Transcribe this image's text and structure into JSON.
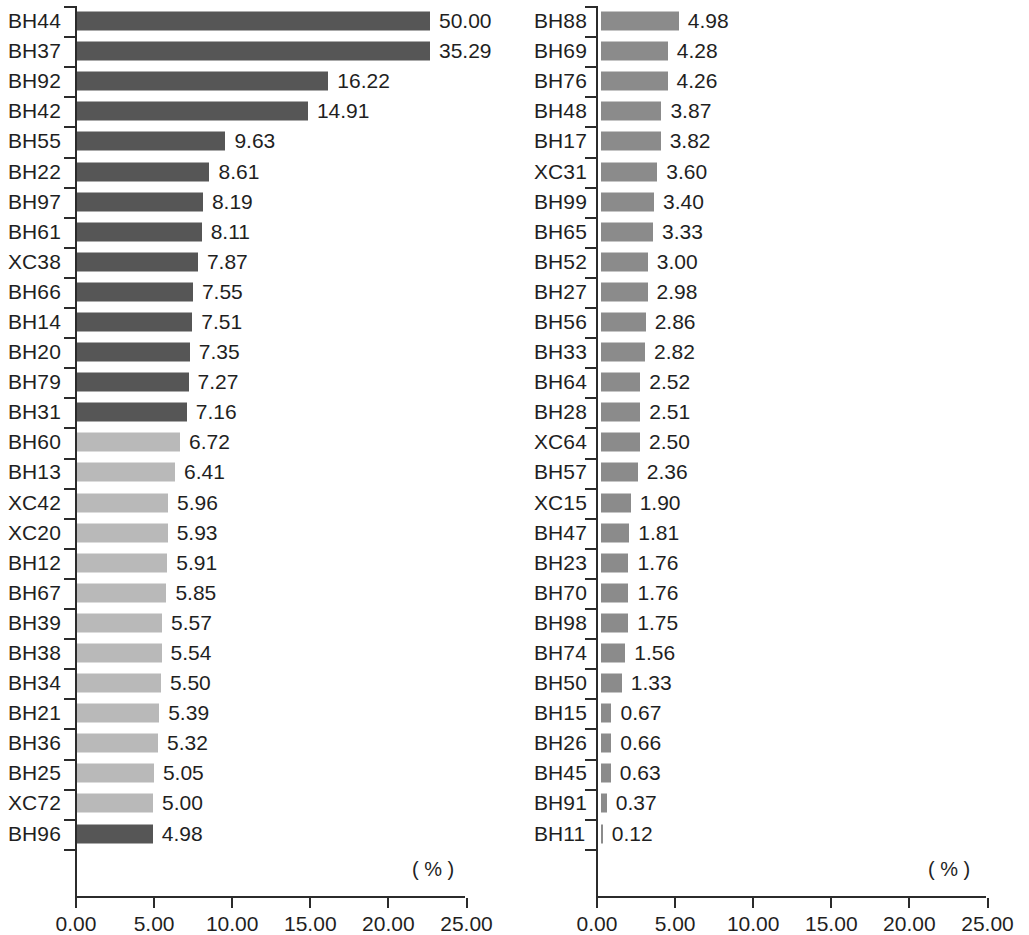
{
  "chart_data": [
    {
      "type": "bar",
      "orientation": "horizontal",
      "panel": "left",
      "title": "",
      "xlabel": "( % )",
      "ylabel": "",
      "xlim": [
        0,
        25
      ],
      "xticks": [
        0,
        5,
        10,
        15,
        20,
        25
      ],
      "xtick_labels": [
        "0.00",
        "5.00",
        "10.00",
        "15.00",
        "20.00",
        "25.00"
      ],
      "grid": false,
      "legend": "none",
      "clipped_note": "Bars exceeding 25.00 are drawn clipped at the plot edge",
      "colors": {
        "dark": "#565656",
        "light": "#b9b9b9"
      },
      "categories": [
        "BH44",
        "BH37",
        "BH92",
        "BH42",
        "BH55",
        "BH22",
        "BH97",
        "BH61",
        "XC38",
        "BH66",
        "BH14",
        "BH20",
        "BH79",
        "BH31",
        "BH60",
        "BH13",
        "XC42",
        "XC20",
        "BH12",
        "BH67",
        "BH39",
        "BH38",
        "BH34",
        "BH21",
        "BH36",
        "BH25",
        "XC72",
        "BH96"
      ],
      "values": [
        50.0,
        35.29,
        16.22,
        14.91,
        9.63,
        8.61,
        8.19,
        8.11,
        7.87,
        7.55,
        7.51,
        7.35,
        7.27,
        7.16,
        6.72,
        6.41,
        5.96,
        5.93,
        5.91,
        5.85,
        5.57,
        5.54,
        5.5,
        5.39,
        5.32,
        5.05,
        5.0,
        4.98
      ],
      "value_labels": [
        "50.00",
        "35.29",
        "16.22",
        "14.91",
        "9.63",
        "8.61",
        "8.19",
        "8.11",
        "7.87",
        "7.55",
        "7.51",
        "7.35",
        "7.27",
        "7.16",
        "6.72",
        "6.41",
        "5.96",
        "5.93",
        "5.91",
        "5.85",
        "5.57",
        "5.54",
        "5.50",
        "5.39",
        "5.32",
        "5.05",
        "5.00",
        "4.98"
      ],
      "bar_shades": [
        "dark",
        "dark",
        "dark",
        "dark",
        "dark",
        "dark",
        "dark",
        "dark",
        "dark",
        "dark",
        "dark",
        "dark",
        "dark",
        "dark",
        "light",
        "light",
        "light",
        "light",
        "light",
        "light",
        "light",
        "light",
        "light",
        "light",
        "light",
        "light",
        "light",
        "dark"
      ]
    },
    {
      "type": "bar",
      "orientation": "horizontal",
      "panel": "right",
      "title": "",
      "xlabel": "( % )",
      "ylabel": "",
      "xlim": [
        0,
        25
      ],
      "xticks": [
        0,
        5,
        10,
        15,
        20,
        25
      ],
      "xtick_labels": [
        "0.00",
        "5.00",
        "10.00",
        "15.00",
        "20.00",
        "25.00"
      ],
      "grid": false,
      "legend": "none",
      "colors": {
        "mid": "#8b8b8b"
      },
      "categories": [
        "BH88",
        "BH69",
        "BH76",
        "BH48",
        "BH17",
        "XC31",
        "BH99",
        "BH65",
        "BH52",
        "BH27",
        "BH56",
        "BH33",
        "BH64",
        "BH28",
        "XC64",
        "BH57",
        "XC15",
        "BH47",
        "BH23",
        "BH70",
        "BH98",
        "BH74",
        "BH50",
        "BH15",
        "BH26",
        "BH45",
        "BH91",
        "BH11"
      ],
      "values": [
        4.98,
        4.28,
        4.26,
        3.87,
        3.82,
        3.6,
        3.4,
        3.33,
        3.0,
        2.98,
        2.86,
        2.82,
        2.52,
        2.51,
        2.5,
        2.36,
        1.9,
        1.81,
        1.76,
        1.76,
        1.75,
        1.56,
        1.33,
        0.67,
        0.66,
        0.63,
        0.37,
        0.12
      ],
      "value_labels": [
        "4.98",
        "4.28",
        "4.26",
        "3.87",
        "3.82",
        "3.60",
        "3.40",
        "3.33",
        "3.00",
        "2.98",
        "2.86",
        "2.82",
        "2.52",
        "2.51",
        "2.50",
        "2.36",
        "1.90",
        "1.81",
        "1.76",
        "1.76",
        "1.75",
        "1.56",
        "1.33",
        "0.67",
        "0.66",
        "0.63",
        "0.37",
        "0.12"
      ],
      "bar_shades": [
        "mid",
        "mid",
        "mid",
        "mid",
        "mid",
        "mid",
        "mid",
        "mid",
        "mid",
        "mid",
        "mid",
        "mid",
        "mid",
        "mid",
        "mid",
        "mid",
        "mid",
        "mid",
        "mid",
        "mid",
        "mid",
        "mid",
        "mid",
        "mid",
        "mid",
        "mid",
        "mid",
        "mid"
      ]
    }
  ]
}
